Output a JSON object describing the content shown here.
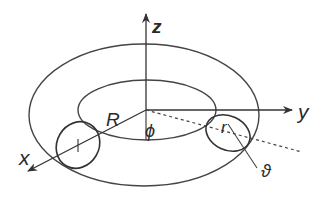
{
  "figure": {
    "labels": {
      "z_axis": "z",
      "y_axis": "y",
      "x_axis": "x",
      "major_radius": "R",
      "azimuth": "ϕ",
      "minor_radius": "r",
      "poloidal_angle": "ϑ"
    },
    "colors": {
      "line": "#444444",
      "text": "#2a2a2a",
      "background": "#ffffff"
    }
  }
}
